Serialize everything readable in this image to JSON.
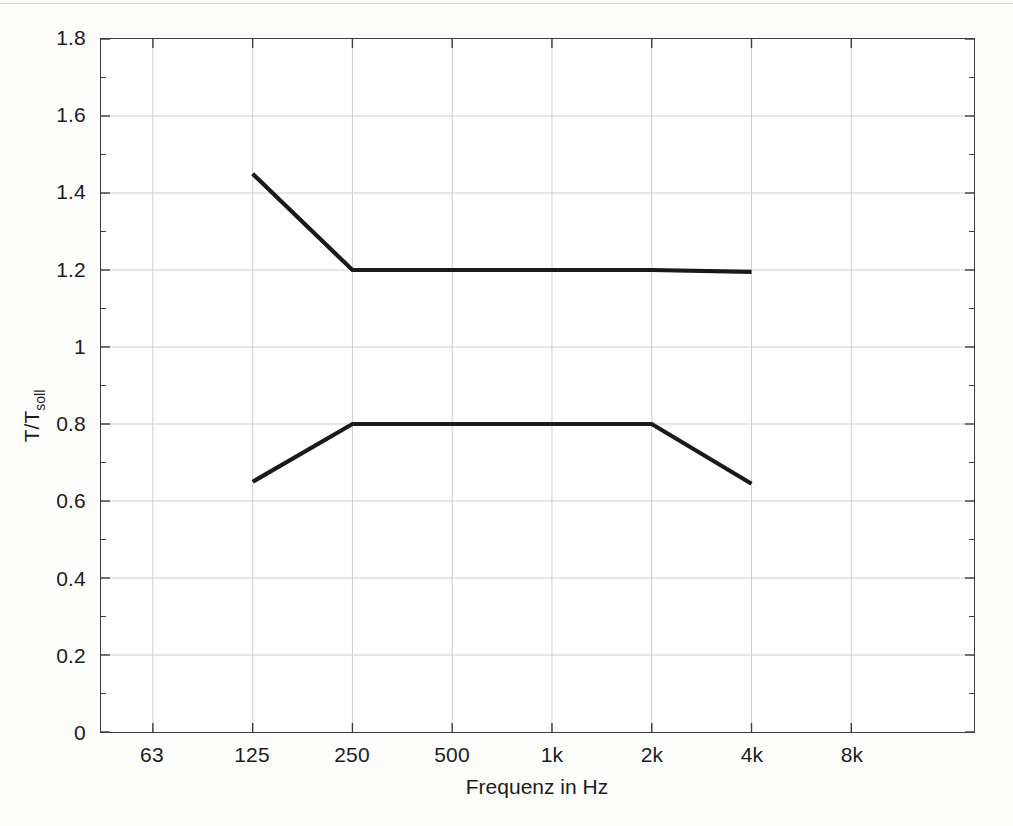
{
  "chart_data": {
    "type": "line",
    "title": "",
    "xlabel": "Frequenz in Hz",
    "ylabel": "T/T_soll",
    "ylabel_base": "T/T",
    "ylabel_sub": "soll",
    "x_tick_labels": [
      "63",
      "125",
      "250",
      "500",
      "1k",
      "2k",
      "4k",
      "8k"
    ],
    "x_tick_values": [
      63,
      125,
      250,
      500,
      1000,
      2000,
      4000,
      8000
    ],
    "y_tick_labels": [
      "0",
      "0.2",
      "0.4",
      "0.6",
      "0.8",
      "1",
      "1.2",
      "1.4",
      "1.6",
      "1.8"
    ],
    "y_tick_values": [
      0,
      0.2,
      0.4,
      0.6,
      0.8,
      1,
      1.2,
      1.4,
      1.6,
      1.8
    ],
    "ylim": [
      0,
      1.8
    ],
    "grid": true,
    "legend": "none",
    "line_color": "#1a1a1a",
    "grid_color": "#cfcfcf",
    "axis_color": "#3c3c3c",
    "series": [
      {
        "name": "upper-tolerance",
        "x": [
          "125",
          "250",
          "500",
          "1k",
          "2k",
          "4k"
        ],
        "values": [
          1.45,
          1.2,
          1.2,
          1.2,
          1.2,
          1.195
        ]
      },
      {
        "name": "lower-tolerance",
        "x": [
          "125",
          "250",
          "500",
          "1k",
          "2k",
          "4k"
        ],
        "values": [
          0.65,
          0.8,
          0.8,
          0.8,
          0.8,
          0.645
        ]
      }
    ]
  }
}
